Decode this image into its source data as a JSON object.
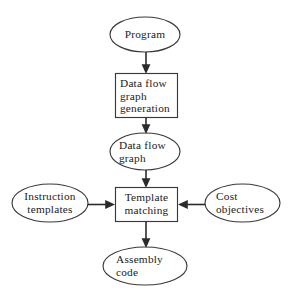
{
  "diagram": {
    "background_color": "#ffffff",
    "stroke_color": "#3a3a3a",
    "arrow_color": "#2b2b2b",
    "text_color": "#1b1b1b",
    "nodes": [
      {
        "id": "program",
        "label": "Program",
        "shape": "ellipse",
        "align": "center",
        "cx": 145,
        "cy": 34.5,
        "rx": 35,
        "ry": 17.5
      },
      {
        "id": "dfg-generation",
        "label": "Data flow\ngraph\ngeneration",
        "shape": "rect",
        "align": "left",
        "x": 115.5,
        "y": 73.5,
        "w": 62,
        "h": 44
      },
      {
        "id": "data-flow-graph",
        "label": "Data flow\ngraph",
        "shape": "ellipse",
        "align": "left",
        "cx": 145,
        "cy": 151.5,
        "rx": 35,
        "ry": 18.5
      },
      {
        "id": "instruction-templates",
        "label": "Instruction\ntemplates",
        "shape": "ellipse",
        "align": "center",
        "cx": 50,
        "cy": 203,
        "rx": 38,
        "ry": 19
      },
      {
        "id": "template-matching",
        "label": "Template\nmatching",
        "shape": "rect",
        "align": "center",
        "x": 115.5,
        "y": 187.5,
        "w": 62,
        "h": 34
      },
      {
        "id": "cost-objectives",
        "label": "Cost\nobjectives",
        "shape": "ellipse",
        "align": "left",
        "cx": 242.5,
        "cy": 203,
        "rx": 37.5,
        "ry": 19
      },
      {
        "id": "assembly-code",
        "label": "Assembly\ncode",
        "shape": "ellipse",
        "align": "left",
        "cx": 145,
        "cy": 266,
        "rx": 42,
        "ry": 19
      }
    ],
    "edges": [
      {
        "id": "program-to-dfg-generation",
        "from": "program",
        "to": "dfg-generation",
        "direction": "down"
      },
      {
        "id": "dfg-generation-to-graph",
        "from": "dfg-generation",
        "to": "data-flow-graph",
        "direction": "down"
      },
      {
        "id": "graph-to-template-matching",
        "from": "data-flow-graph",
        "to": "template-matching",
        "direction": "down"
      },
      {
        "id": "templates-to-matching",
        "from": "instruction-templates",
        "to": "template-matching",
        "direction": "right"
      },
      {
        "id": "cost-to-matching",
        "from": "cost-objectives",
        "to": "template-matching",
        "direction": "left"
      },
      {
        "id": "matching-to-assembly",
        "from": "template-matching",
        "to": "assembly-code",
        "direction": "down"
      }
    ]
  }
}
